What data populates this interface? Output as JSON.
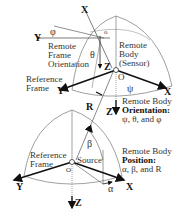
{
  "diagram": {
    "top": {
      "remote_frame_label": [
        "Remote",
        "Frame",
        "Orientation"
      ],
      "remote_body_label": [
        "Remote",
        "Body",
        "(Sensor)"
      ],
      "reference_frame_label": [
        "Reference",
        "Frame"
      ],
      "origin": "O",
      "axes": {
        "x": "X",
        "y": "Y",
        "z": "Z"
      },
      "remote_axes": {
        "x": "X",
        "y": "Y",
        "z": "Z"
      },
      "angles": {
        "psi": "ψ",
        "theta": "θ",
        "phi": "φ"
      },
      "range": "R",
      "caption_line1": "Remote Body",
      "caption_line2": "Orientation:",
      "caption_line3": "ψ, θ,  and φ"
    },
    "bottom": {
      "reference_frame_label": [
        "Reference",
        "Frame"
      ],
      "source_label": "Source",
      "origin": "O",
      "axes": {
        "x": "X",
        "y": "Y",
        "z": "Z"
      },
      "angles": {
        "alpha": "α",
        "beta": "β"
      },
      "caption_line1": "Remote Body",
      "caption_line2": "Position:",
      "caption_line3": "α, β,  and R"
    },
    "colors": {
      "line": "#111111",
      "thin": "#666666",
      "text": "#333333"
    }
  }
}
